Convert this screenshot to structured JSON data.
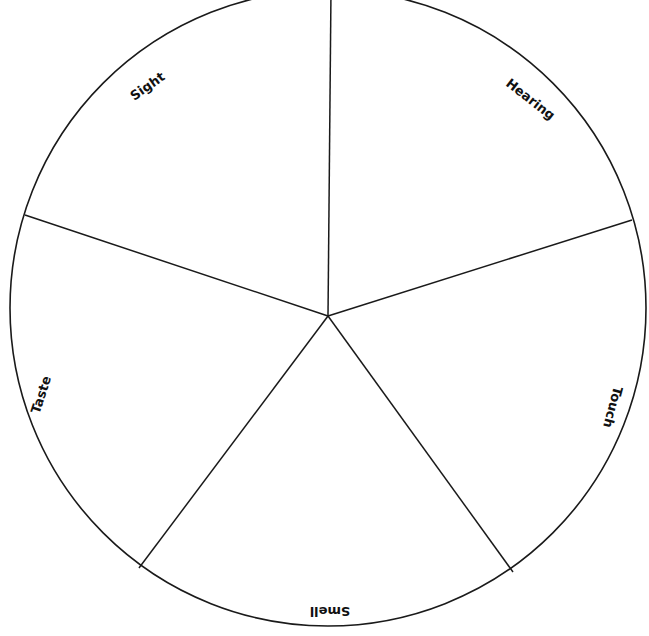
{
  "diagram": {
    "stroke_color": "#1a1a1a",
    "background": "#ffffff",
    "circle": {
      "cx": 328,
      "cy": 308,
      "r": 318
    },
    "hub": {
      "x": 328,
      "y": 316
    },
    "spokes": [
      {
        "x": 331,
        "y": -10
      },
      {
        "x": 632,
        "y": 220
      },
      {
        "x": 513,
        "y": 572
      },
      {
        "x": 139,
        "y": 568
      },
      {
        "x": 25,
        "y": 215
      }
    ],
    "segments": [
      {
        "label": "Sight",
        "x": 148,
        "y": 87,
        "rotate": -35
      },
      {
        "label": "Hearing",
        "x": 530,
        "y": 100,
        "rotate": 38
      },
      {
        "label": "Touch",
        "x": 612,
        "y": 407,
        "rotate": 105
      },
      {
        "label": "Smell",
        "x": 330,
        "y": 610,
        "rotate": 180
      },
      {
        "label": "Taste",
        "x": 42,
        "y": 395,
        "rotate": -72
      }
    ]
  }
}
